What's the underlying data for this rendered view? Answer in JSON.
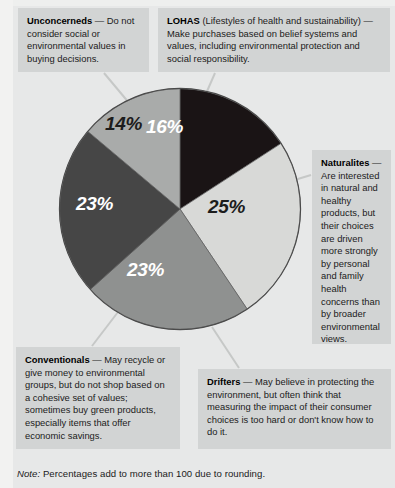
{
  "chart_data": {
    "type": "pie",
    "title": "",
    "categories": [
      "LOHAS",
      "Naturalites",
      "Drifters",
      "Conventionals",
      "Unconcerneds"
    ],
    "values": [
      16,
      25,
      23,
      23,
      14
    ],
    "labels": [
      "16%",
      "25%",
      "23%",
      "23%",
      "14%"
    ],
    "colors": [
      "#1a1415",
      "#d8d9d7",
      "#8f9190",
      "#464646",
      "#a9abaa"
    ],
    "label_text_colors": [
      "#ffffff",
      "#1c1c1c",
      "#ffffff",
      "#ffffff",
      "#1c1c1c"
    ],
    "start_angle_deg": 0,
    "direction": "clockwise",
    "legend": "callout boxes",
    "grid": false,
    "note": "Percentages add to more than 100 due to rounding."
  },
  "slices": [
    {
      "key": "lohas",
      "label": "16%",
      "value": 16,
      "color": "#1a1415",
      "text_color": "#ffffff"
    },
    {
      "key": "naturalites",
      "label": "25%",
      "value": 25,
      "color": "#d8d9d7",
      "text_color": "#1c1c1c"
    },
    {
      "key": "drifters",
      "label": "23%",
      "value": 23,
      "color": "#8f9190",
      "text_color": "#ffffff"
    },
    {
      "key": "conventionals",
      "label": "23%",
      "value": 23,
      "color": "#464646",
      "text_color": "#ffffff"
    },
    {
      "key": "unconcerneds",
      "label": "14%",
      "value": 14,
      "color": "#a9abaa",
      "text_color": "#1c1c1c"
    }
  ],
  "callouts": {
    "unconcerneds": {
      "term": "Unconcerneds",
      "dash": " — ",
      "body": "Do not consider social or environmental values in buying decisions."
    },
    "lohas": {
      "term": "LOHAS",
      "paren": " (Lifestyles of health and sustainability)",
      "dash": " — ",
      "body": "Make purchases based on belief systems and values, including environmental protection and social responsibility."
    },
    "naturalites": {
      "term": "Naturalites",
      "dash": " — ",
      "body": "Are interested in natural and healthy products, but their choices are driven more strongly by personal and family health concerns than by broader environmental views."
    },
    "drifters": {
      "term": "Drifters",
      "dash": " — ",
      "body": "May believe in protecting the environment, but often think that measuring the impact of their consumer choices is too hard or don't know how to do it."
    },
    "conventionals": {
      "term": "Conventionals",
      "dash": " — ",
      "body": "May recycle or give money to environmental groups, but do not shop based on a cohesive set of values; sometimes buy green products, especially items that offer economic savings."
    }
  },
  "note": {
    "prefix": "Note:",
    "text": " Percentages add to more than 100 due to rounding."
  }
}
